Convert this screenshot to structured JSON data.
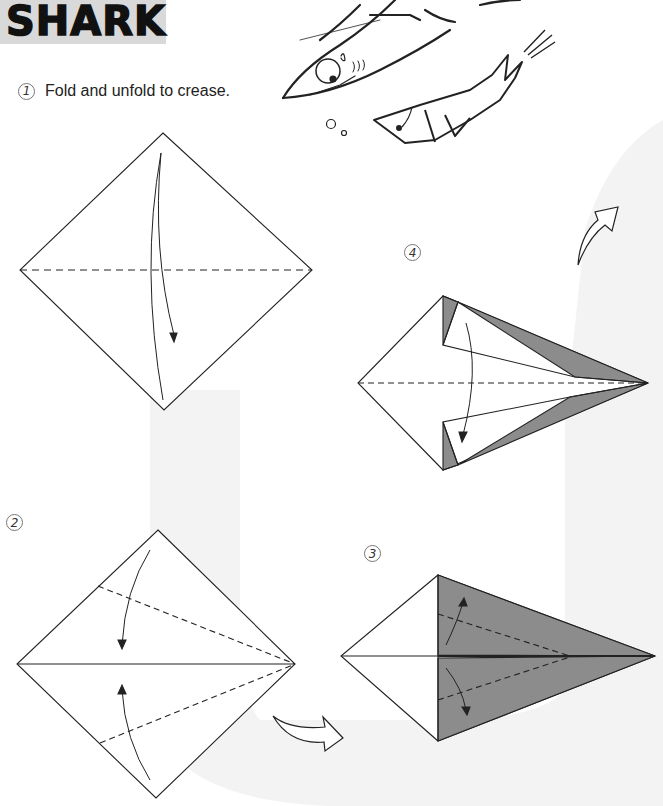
{
  "title": "SHARK",
  "steps": [
    {
      "number": "1",
      "instruction": "Fold and unfold to crease."
    },
    {
      "number": "2",
      "instruction": ""
    },
    {
      "number": "3",
      "instruction": ""
    },
    {
      "number": "4",
      "instruction": ""
    }
  ],
  "colors": {
    "title_bg": "#d9d9d9",
    "shaded_paper": "#8c8c8c",
    "background_band": "#f2f2f2",
    "line": "#222222"
  }
}
